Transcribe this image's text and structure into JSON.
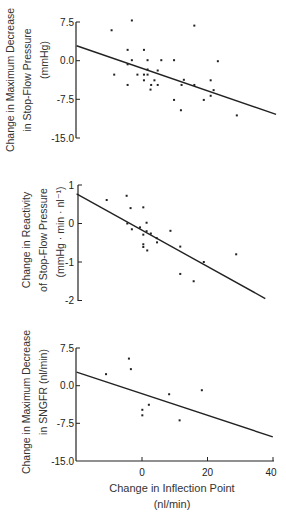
{
  "chart_data": [
    {
      "type": "scatter",
      "title": "",
      "ylabel": [
        "Change in Maximum Decrease",
        "in Stop-Flow Pressure",
        "(mmHg)"
      ],
      "xlabel": "",
      "xlim": [
        -20,
        40
      ],
      "ylim": [
        -15,
        7.5
      ],
      "yticks": [
        "7.5",
        "0.0",
        "-7.5",
        "-15.0"
      ],
      "yticks_values": [
        7.5,
        0,
        -7.5,
        -15
      ],
      "points": [
        [
          -9.3,
          5.9
        ],
        [
          -3.1,
          7.8
        ],
        [
          -4.4,
          2.1
        ],
        [
          0.6,
          2.1
        ],
        [
          -8.5,
          -2.7
        ],
        [
          -4.4,
          -0.7
        ],
        [
          -3.1,
          0.1
        ],
        [
          -4.4,
          -4.7
        ],
        [
          -1.4,
          -2.7
        ],
        [
          0.6,
          -2.7
        ],
        [
          0.6,
          -3.8
        ],
        [
          1.7,
          0.1
        ],
        [
          1.7,
          -1.7
        ],
        [
          1.7,
          -2.7
        ],
        [
          2.8,
          -4.7
        ],
        [
          2.6,
          -5.6
        ],
        [
          3.8,
          -3.8
        ],
        [
          4.8,
          -1.9
        ],
        [
          4.8,
          -4.7
        ],
        [
          5.9,
          0.1
        ],
        [
          9.8,
          0.1
        ],
        [
          9.8,
          -7.6
        ],
        [
          11.9,
          -9.6
        ],
        [
          12.1,
          -4.7
        ],
        [
          12.8,
          -3.7
        ],
        [
          16,
          6.8
        ],
        [
          16,
          -4.7
        ],
        [
          18.9,
          -7.6
        ],
        [
          21,
          -3.8
        ],
        [
          21,
          -6.8
        ],
        [
          21.9,
          -5.7
        ],
        [
          23.2,
          -0.1
        ],
        [
          29,
          -10.6
        ]
      ],
      "regression_line": [
        [
          -20,
          2.9
        ],
        [
          41,
          -10.4
        ]
      ],
      "grid": false
    },
    {
      "type": "scatter",
      "title": "",
      "ylabel": [
        "Change in Reactivity",
        "of Stop-Flow Pressure",
        "(mmHg · min · nl⁻¹)"
      ],
      "xlabel": "",
      "xlim": [
        -20,
        40
      ],
      "ylim": [
        -2,
        1
      ],
      "yticks": [
        "1",
        "0",
        "-1",
        "-2"
      ],
      "yticks_values": [
        1,
        0,
        -1,
        -2
      ],
      "points": [
        [
          -10.8,
          0.61
        ],
        [
          -4.7,
          0.72
        ],
        [
          -3.5,
          0.4
        ],
        [
          0.4,
          0.42
        ],
        [
          -4.5,
          0.0
        ],
        [
          -3.1,
          -0.15
        ],
        [
          -0.6,
          -0.1
        ],
        [
          0.4,
          -0.29
        ],
        [
          0.4,
          -0.54
        ],
        [
          0.4,
          -0.61
        ],
        [
          1.4,
          0.02
        ],
        [
          1.4,
          -0.2
        ],
        [
          1.6,
          -0.7
        ],
        [
          2.7,
          -0.26
        ],
        [
          4.5,
          -0.38
        ],
        [
          4.6,
          -0.49
        ],
        [
          8.7,
          -0.19
        ],
        [
          11.7,
          -0.6
        ],
        [
          11.7,
          -1.31
        ],
        [
          15.8,
          -1.5
        ],
        [
          18.9,
          -1.0
        ],
        [
          28.8,
          -0.8
        ]
      ],
      "regression_line": [
        [
          -20,
          0.77
        ],
        [
          37.7,
          -1.95
        ]
      ],
      "grid": false
    },
    {
      "type": "scatter",
      "title": "",
      "ylabel": [
        "Change in Maximum Decrease",
        "in SNGFR (nl/min)"
      ],
      "xlabel": [
        "Change in Inflection Point",
        "(nl/min)"
      ],
      "xlim": [
        -20,
        40
      ],
      "ylim": [
        -15,
        7.5
      ],
      "xticks": [
        "0",
        "20",
        "40"
      ],
      "xticks_values": [
        0,
        20,
        40
      ],
      "yticks": [
        "7.5",
        "0.0",
        "-7.5",
        "-15.0"
      ],
      "yticks_values": [
        7.5,
        0,
        -7.5,
        -15
      ],
      "points": [
        [
          -11,
          2.3
        ],
        [
          -4,
          5.4
        ],
        [
          -3.4,
          3.3
        ],
        [
          0.1,
          -4.8
        ],
        [
          0.1,
          -5.9
        ],
        [
          2.1,
          -3.8
        ],
        [
          8.3,
          -1.7
        ],
        [
          11.5,
          -6.9
        ],
        [
          18.3,
          -0.9
        ]
      ],
      "regression_line": [
        [
          -20,
          2.7
        ],
        [
          40,
          -10.2
        ]
      ],
      "grid": false
    }
  ],
  "panels": [
    {
      "ylabel": [
        "Change in Maximum Decrease",
        "in Stop-Flow Pressure",
        "(mmHg)"
      ],
      "yticks": [
        "7.5",
        "0.0",
        "-7.5",
        "-15.0"
      ]
    },
    {
      "ylabel": [
        "Change in Reactivity",
        "of Stop-Flow Pressure",
        "(mmHg · min · nl⁻¹)"
      ],
      "yticks": [
        "1",
        "0",
        "-1",
        "-2"
      ]
    },
    {
      "ylabel": [
        "Change in Maximum Decrease",
        "in SNGFR (nl/min)"
      ],
      "yticks": [
        "7.5",
        "0.0",
        "-7.5",
        "-15.0"
      ],
      "xticks": [
        "0",
        "20",
        "40"
      ],
      "xlabel": [
        "Change in Inflection Point",
        "(nl/min)"
      ]
    }
  ]
}
